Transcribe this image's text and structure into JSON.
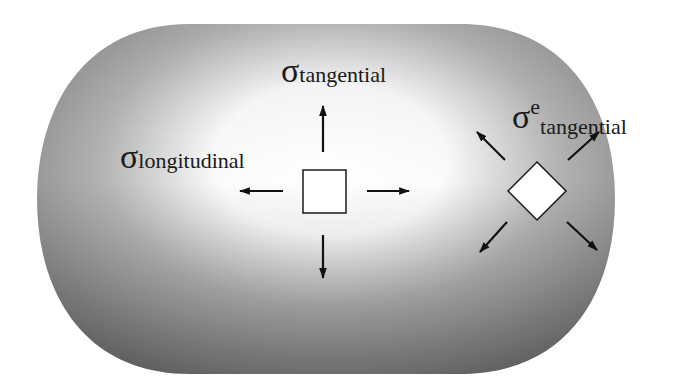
{
  "figure": {
    "shape": "capsule",
    "colors": {
      "highlight": "#ffffff",
      "mid": "#b0b0b0",
      "shadow": "#6a6a6a",
      "ink": "#1a1a1a",
      "element_fill": "#ffffff"
    }
  },
  "labels": {
    "tangential": {
      "symbol": "σ",
      "subscript": "tangential"
    },
    "longitudinal": {
      "symbol": "σ",
      "subscript": "longitudinal"
    },
    "tangential_e": {
      "symbol": "σ",
      "superscript": "e",
      "subscript": "tangential"
    }
  },
  "elements": {
    "square": {
      "name": "stress-element-axial"
    },
    "diamond": {
      "name": "stress-element-rotated"
    }
  },
  "icons": {
    "arrow_up": "arrow-up-icon",
    "arrow_down": "arrow-down-icon",
    "arrow_left": "arrow-left-icon",
    "arrow_right": "arrow-right-icon",
    "arrow_ul": "arrow-up-left-icon",
    "arrow_ur": "arrow-up-right-icon",
    "arrow_dl": "arrow-down-left-icon",
    "arrow_dr": "arrow-down-right-icon"
  }
}
